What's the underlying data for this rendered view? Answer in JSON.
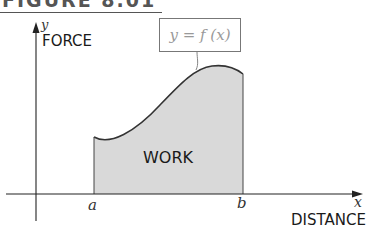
{
  "caption": "FIGURE 8.01",
  "axes": {
    "y_symbol": "y",
    "y_title": "FORCE",
    "x_symbol": "x",
    "x_title": "DISTANCE"
  },
  "curve_label": "y = f (x)",
  "region_label": "WORK",
  "bounds": {
    "a": "a",
    "b": "b"
  },
  "colors": {
    "fill": "#d9d9d9",
    "stroke": "#333333",
    "axis": "#222222"
  }
}
